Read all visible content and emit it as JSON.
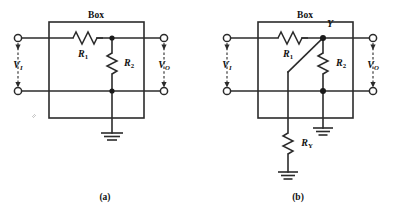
{
  "figure": {
    "background_color": "#ffffff",
    "line_color": "#2b2b2b",
    "panels": [
      {
        "id": "panel-a",
        "caption": "(a)",
        "box_label": "Box",
        "input_label": "V",
        "input_sub": "I",
        "output_label": "V",
        "output_sub": "O",
        "resistors": [
          {
            "name": "R",
            "sub": "1",
            "orientation": "horizontal"
          },
          {
            "name": "R",
            "sub": "2",
            "orientation": "vertical"
          }
        ],
        "grounds": 1,
        "node_labels": []
      },
      {
        "id": "panel-b",
        "caption": "(b)",
        "box_label": "Box",
        "input_label": "V",
        "input_sub": "I",
        "output_label": "V",
        "output_sub": "O",
        "resistors": [
          {
            "name": "R",
            "sub": "1",
            "orientation": "horizontal"
          },
          {
            "name": "R",
            "sub": "2",
            "orientation": "vertical"
          },
          {
            "name": "R",
            "sub": "Y",
            "orientation": "vertical"
          }
        ],
        "grounds": 2,
        "node_labels": [
          {
            "name": "Y",
            "sub": ""
          }
        ]
      }
    ]
  }
}
